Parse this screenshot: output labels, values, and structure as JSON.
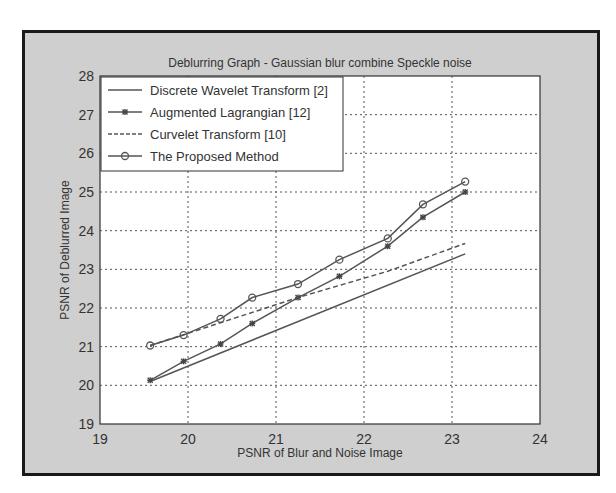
{
  "chart_data": {
    "type": "line",
    "title": "Deblurring Graph - Gaussian blur combine Speckle noise",
    "xlabel": "PSNR of Blur and Noise Image",
    "ylabel": "PSNR of Deblurred Image",
    "xlim": [
      19,
      24
    ],
    "ylim": [
      19,
      28
    ],
    "xticks": [
      19,
      20,
      21,
      22,
      23,
      24
    ],
    "yticks": [
      19,
      20,
      21,
      22,
      23,
      24,
      25,
      26,
      27,
      28
    ],
    "grid": true,
    "legend_position": "upper left",
    "series": [
      {
        "name": "Discrete Wavelet Transform [2]",
        "style": "solid",
        "marker": "none",
        "x": [
          19.57,
          23.15
        ],
        "y": [
          20.1,
          23.4
        ]
      },
      {
        "name": "Augmented Lagrangian [12]",
        "style": "solid",
        "marker": "asterisk",
        "x": [
          19.57,
          19.95,
          20.37,
          20.73,
          21.25,
          21.72,
          22.27,
          22.67,
          23.15
        ],
        "y": [
          20.13,
          20.62,
          21.07,
          21.6,
          22.27,
          22.82,
          23.6,
          24.35,
          25.0
        ]
      },
      {
        "name": "Curvelet Transform [10]",
        "style": "dashed",
        "marker": "none",
        "x": [
          19.57,
          20.37,
          21.25,
          22.27,
          23.15
        ],
        "y": [
          21.03,
          21.62,
          22.27,
          22.95,
          23.67
        ]
      },
      {
        "name": "The Proposed Method",
        "style": "solid",
        "marker": "circle",
        "x": [
          19.57,
          19.95,
          20.37,
          20.73,
          21.25,
          21.72,
          22.27,
          22.67,
          23.15
        ],
        "y": [
          21.03,
          21.3,
          21.72,
          22.27,
          22.62,
          23.25,
          23.8,
          24.68,
          25.27
        ]
      }
    ]
  }
}
